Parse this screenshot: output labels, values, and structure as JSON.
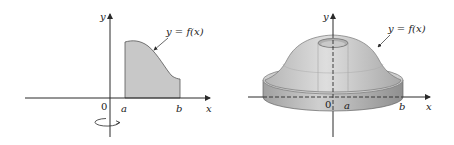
{
  "figure": {
    "left_panel": {
      "description": "Region under y = f(x) between x = a and x = b, rotated about the y-axis",
      "y_axis_label": "y",
      "x_axis_label": "x",
      "origin_label": "0",
      "a_label": "a",
      "b_label": "b",
      "curve_label": "y = f(x)",
      "rotation_indicator": "rotation-arrow-about-y-axis"
    },
    "right_panel": {
      "description": "Solid of revolution obtained by rotating the region about the y-axis",
      "y_axis_label": "y",
      "x_axis_label": "x",
      "origin_label": "0",
      "a_label": "a",
      "b_label": "b",
      "curve_label": "y = f(x)"
    },
    "colors": {
      "axis": "#2a2a2a",
      "region_fill": "#c8c8c8",
      "solid_light": "#d9d9d9",
      "solid_mid": "#bdbdbd",
      "solid_dark": "#9a9a9a",
      "background": "#ffffff"
    }
  }
}
